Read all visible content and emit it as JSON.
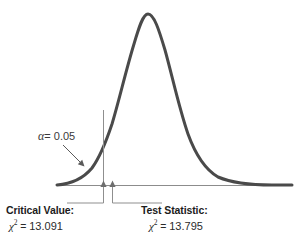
{
  "figure": {
    "name": "chi-square-hypothesis-test-figure",
    "background_color": "#ffffff",
    "curve_color": "#4a4a4a",
    "axis_color": "#8c8c8c",
    "marker_color": "#7a7a7a",
    "text_color": "#2b2b2b"
  },
  "annotations": {
    "alpha": {
      "symbol": "α",
      "equals": "= 0.05",
      "full_text": "α = 0.05",
      "value": 0.05
    },
    "critical_value": {
      "title": "Critical Value:",
      "chi": "χ",
      "superscript": "2",
      "equals": "=",
      "value": "13.091"
    },
    "test_statistic": {
      "title": "Test Statistic:",
      "chi": "χ",
      "superscript": "2",
      "equals": "=",
      "value": "13.795"
    }
  },
  "chart_data": {
    "type": "line",
    "title": "",
    "subtitle": "",
    "xlabel": "",
    "ylabel": "",
    "distribution": "chi-square density (right-skewed)",
    "grid": false,
    "legend": null,
    "axis": {
      "baseline_y_px": 185,
      "x_start_px": 57,
      "x_end_px": 292,
      "y_axis_shown": false,
      "x_tick_labels": []
    },
    "curve": {
      "peak_x_px": 143,
      "peak_y_px": 14,
      "left_foot_x_px": 58,
      "right_foot_x_px": 286,
      "stroke_width_px": 3,
      "path": "M 57 185 C 70 184, 82 180, 92 168 C 100 157, 106 142, 112 124 C 119 101, 126 70, 134 44 C 139 27, 143 14, 148 14 C 154 14, 159 30, 165 50 C 172 75, 179 108, 188 134 C 196 156, 206 170, 218 177 C 232 183, 254 185, 272 185 L 292 185"
    },
    "markers": [
      {
        "name": "critical-value-marker",
        "label": "Critical Value",
        "chi_square": 13.091,
        "x_px": 103,
        "top_y_px": 110,
        "baseline_y_px": 185,
        "arrow": "up",
        "leader_elbow_y_px": 203,
        "leader_direction": "left",
        "leader_end_x_px": 67
      },
      {
        "name": "test-statistic-marker",
        "label": "Test Statistic",
        "chi_square": 13.795,
        "x_px": 112,
        "top_y_px": 188,
        "baseline_y_px": 185,
        "arrow": "up",
        "leader_elbow_y_px": 203,
        "leader_direction": "right",
        "leader_end_x_px": 162
      }
    ],
    "alpha_pointer": {
      "from_x_px": 63,
      "from_y_px": 145,
      "to_x_px": 84,
      "to_y_px": 166,
      "arrow": true
    },
    "shaded_region": {
      "present": false,
      "description": "rejection region right of critical value (not shaded)"
    }
  }
}
